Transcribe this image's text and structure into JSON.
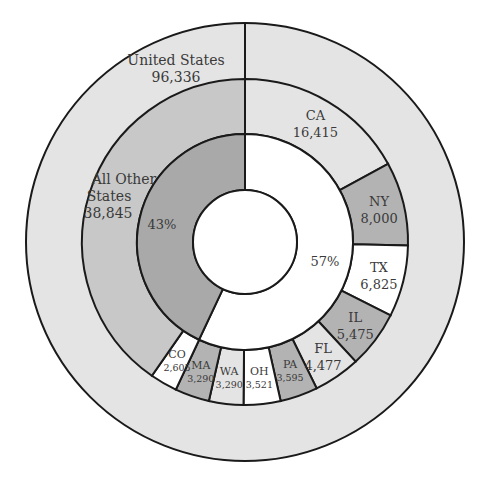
{
  "chart_data": {
    "type": "pie",
    "subtype": "nested-donut",
    "title": "",
    "outer_ring": {
      "label": "United States",
      "value": 96336,
      "value_label": "96,336",
      "color": "#e4e4e4"
    },
    "middle_ring": [
      {
        "name": "CA",
        "value": 16415,
        "value_label": "16,415",
        "color": "#e4e4e4",
        "group": "top10"
      },
      {
        "name": "NY",
        "value": 8000,
        "value_label": "8,000",
        "color": "#b3b3b3",
        "group": "top10"
      },
      {
        "name": "TX",
        "value": 6825,
        "value_label": "6,825",
        "color": "#ffffff",
        "group": "top10"
      },
      {
        "name": "IL",
        "value": 5475,
        "value_label": "5,475",
        "color": "#b3b3b3",
        "group": "top10"
      },
      {
        "name": "FL",
        "value": 4477,
        "value_label": "4,477",
        "color": "#e4e4e4",
        "group": "top10"
      },
      {
        "name": "PA",
        "value": 3595,
        "value_label": "3,595",
        "color": "#b3b3b3",
        "group": "top10"
      },
      {
        "name": "OH",
        "value": 3521,
        "value_label": "3,521",
        "color": "#ffffff",
        "group": "top10"
      },
      {
        "name": "WA",
        "value": 3290,
        "value_label": "3,290",
        "color": "#e4e4e4",
        "group": "top10"
      },
      {
        "name": "MA",
        "value": 3290,
        "value_label": "3,290",
        "color": "#b3b3b3",
        "group": "top10"
      },
      {
        "name": "CO",
        "value": 2605,
        "value_label": "2,605",
        "color": "#ffffff",
        "group": "top10"
      },
      {
        "name": "All Other States",
        "value": 38845,
        "value_label": "38,845",
        "color": "#c8c8c8",
        "group": "other"
      }
    ],
    "inner_ring": [
      {
        "name": "Top 10 States",
        "percent": 57,
        "label": "57%",
        "color": "#ffffff"
      },
      {
        "name": "All Other States",
        "percent": 43,
        "label": "43%",
        "color": "#a9a9a9"
      }
    ],
    "start_angle_deg": 0,
    "direction": "clockwise",
    "legend": "none"
  },
  "labels": {
    "us_title": "United States",
    "us_value": "96,336",
    "other_line1": "All Other",
    "other_line2": "States",
    "other_value": "38,845",
    "pct_other": "43%",
    "pct_top": "57%"
  }
}
